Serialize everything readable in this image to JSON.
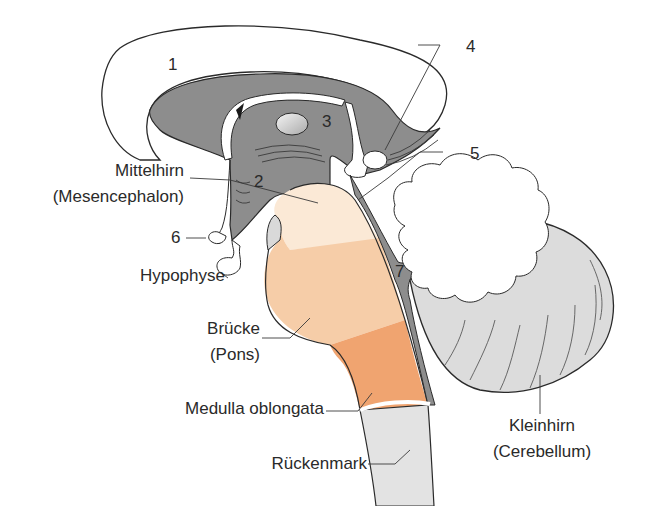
{
  "diagram": {
    "type": "anatomical-illustration",
    "colors": {
      "outline": "#2a2a2a",
      "grey_fill": "#8d8d8d",
      "light_grey": "#d9d9d9",
      "cerebellum_grey": "#dcdcdc",
      "midbrain_cream": "#fbe9d6",
      "pons_peach": "#f6cda8",
      "medulla_orange": "#f0a470",
      "spinal_grey": "#e3e3e3",
      "text": "#2a2a2a"
    },
    "numbers": {
      "n1": "1",
      "n2": "2",
      "n3": "3",
      "n4": "4",
      "n5": "5",
      "n6": "6",
      "n7": "7"
    },
    "labels": {
      "mittelhirn": "Mittelhirn",
      "mesencephalon": "(Mesencephalon)",
      "hypophyse": "Hypophyse",
      "bruecke": "Brücke",
      "pons": "(Pons)",
      "medulla": "Medulla oblongata",
      "rueckenmark": "Rückenmark",
      "kleinhirn": "Kleinhirn",
      "cerebellum": "(Cerebellum)"
    }
  }
}
